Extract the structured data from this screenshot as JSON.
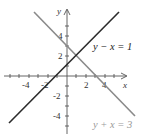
{
  "diagram": {
    "type": "coordinate-plane-two-lines",
    "axes": {
      "x_label": "x",
      "y_label": "y",
      "x_tick_labels": [
        "-4",
        "-2",
        "2",
        "4"
      ],
      "y_tick_labels": [
        "4",
        "2",
        "-2",
        "-4"
      ]
    },
    "lines": [
      {
        "equation": "y − x = 1",
        "color": "#2b2b2b",
        "label_color": "#222222"
      },
      {
        "equation": "y + x = 3",
        "color": "#8a8a8a",
        "label_color": "#9a9a9a"
      }
    ],
    "intersection": {
      "x": 1,
      "y": 2
    }
  }
}
